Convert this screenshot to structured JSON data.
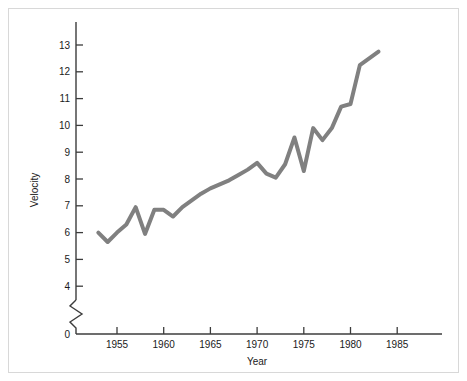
{
  "chart_data": {
    "type": "line",
    "title": "",
    "xlabel": "Year",
    "ylabel": "Velocity",
    "xlim": [
      1951,
      1989
    ],
    "ylim": [
      3.6,
      13.8
    ],
    "grid": false,
    "legend": null,
    "axis_break": {
      "present": true,
      "between": [
        0,
        4
      ],
      "axis": "y"
    },
    "xticks": [
      1955,
      1960,
      1965,
      1970,
      1975,
      1980,
      1985
    ],
    "xtick_labels": [
      "1955",
      "1960",
      "1965",
      "1970",
      "1975",
      "1980",
      "1985"
    ],
    "yticks": [
      0,
      4,
      5,
      6,
      7,
      8,
      9,
      10,
      11,
      12,
      13
    ],
    "ytick_labels": [
      "0",
      "4",
      "5",
      "6",
      "7",
      "8",
      "9",
      "10",
      "11",
      "12",
      "13"
    ],
    "line_color": "#808080",
    "line_width": 4,
    "x": [
      1953,
      1954,
      1955,
      1956,
      1957,
      1958,
      1959,
      1960,
      1961,
      1962,
      1963,
      1964,
      1965,
      1966,
      1967,
      1968,
      1969,
      1970,
      1971,
      1972,
      1973,
      1974,
      1975,
      1976,
      1977,
      1978,
      1979,
      1980,
      1981,
      1982,
      1983
    ],
    "values": [
      6.0,
      5.65,
      6.0,
      6.3,
      6.95,
      5.95,
      6.85,
      6.85,
      6.6,
      6.95,
      7.2,
      7.45,
      7.65,
      7.8,
      7.95,
      8.15,
      8.35,
      8.6,
      8.2,
      8.05,
      8.55,
      9.55,
      8.3,
      9.9,
      9.45,
      9.9,
      10.7,
      10.8,
      12.25,
      12.5,
      12.75
    ],
    "series": [
      {
        "name": "Velocity",
        "color": "#808080",
        "values": [
          6.0,
          5.65,
          6.0,
          6.3,
          6.95,
          5.95,
          6.85,
          6.85,
          6.6,
          6.95,
          7.2,
          7.45,
          7.65,
          7.8,
          7.95,
          8.15,
          8.35,
          8.6,
          8.2,
          8.05,
          8.55,
          9.55,
          8.3,
          9.9,
          9.45,
          9.9,
          10.7,
          10.8,
          12.25,
          12.5,
          12.75
        ]
      }
    ]
  },
  "axes": {
    "y_title": "Velocity",
    "x_title": "Year"
  },
  "colors": {
    "line": "#808080",
    "axis": "#3c3c3c",
    "frame": "#d8d8d8",
    "text": "#1a1a1a",
    "background": "#ffffff"
  }
}
